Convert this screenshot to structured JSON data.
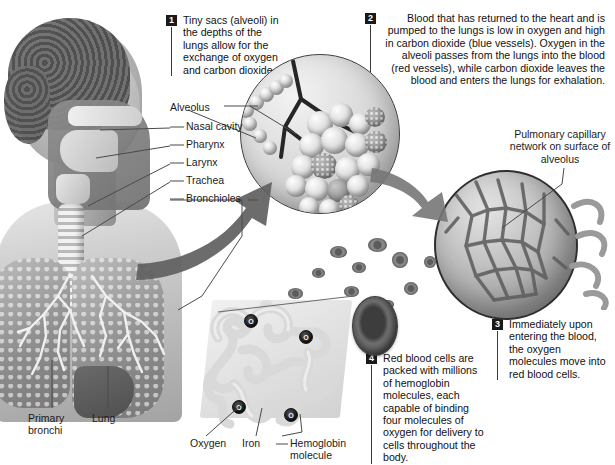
{
  "figure": {
    "background": "#ffffff",
    "text_color": "#1b1b1b",
    "leader_color": "#4a4a4a"
  },
  "callouts": [
    {
      "number": "1",
      "text": "Tiny sacs (alveoli) in the depths of the lungs allow for the exchange of oxygen and carbon dioxide.",
      "align": "left"
    },
    {
      "number": "2",
      "text": "Blood that has returned to the heart and is pumped to the lungs is low in oxygen and high in carbon dioxide (blue vessels). Oxygen in the alveoli passes from the lungs into the blood (red vessels), while carbon dioxide leaves the blood and enters the lungs for exhalation.",
      "align": "right"
    },
    {
      "number": "3",
      "text": "Immediately upon entering the blood, the oxygen molecules move into red blood cells.",
      "align": "left"
    },
    {
      "number": "4",
      "text": "Red blood cells are packed with millions of hemoglobin molecules, each capable of binding four molecules of oxygen for delivery to cells throughout the body.",
      "align": "left"
    }
  ],
  "labels": {
    "alveolus": "Alveolus",
    "nasal_cavity": "Nasal cavity",
    "pharynx": "Pharynx",
    "larynx": "Larynx",
    "trachea": "Trachea",
    "bronchioles": "Bronchioles",
    "pulmonary_capillary": "Pulmonary capillary network on surface of alveolus",
    "primary_bronchi": "Primary bronchi",
    "lung": "Lung",
    "oxygen": "Oxygen",
    "iron": "Iron",
    "hemoglobin_molecule": "Hemoglobin molecule"
  },
  "molecule_markers": {
    "symbol": "O",
    "count": 4
  }
}
